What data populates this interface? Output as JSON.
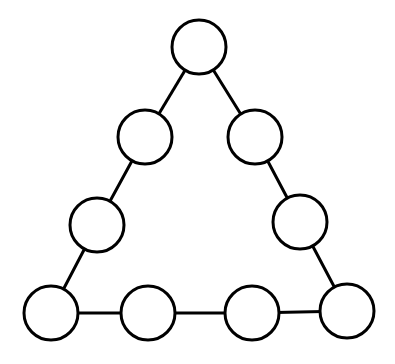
{
  "diagram": {
    "type": "triangle-node-puzzle",
    "canvas": {
      "width": 395,
      "height": 364,
      "background": "#ffffff"
    },
    "style": {
      "stroke": "#000000",
      "fill": "#ffffff",
      "node_radius": 27,
      "stroke_width": 3
    },
    "nodes": [
      {
        "id": "top",
        "cx": 199,
        "cy": 47,
        "label": ""
      },
      {
        "id": "left-upper",
        "cx": 145,
        "cy": 137,
        "label": ""
      },
      {
        "id": "left-lower",
        "cx": 97,
        "cy": 225,
        "label": ""
      },
      {
        "id": "bottom-left",
        "cx": 51,
        "cy": 313,
        "label": ""
      },
      {
        "id": "bottom-mid-1",
        "cx": 148,
        "cy": 313,
        "label": ""
      },
      {
        "id": "bottom-mid-2",
        "cx": 252,
        "cy": 313,
        "label": ""
      },
      {
        "id": "bottom-right",
        "cx": 347,
        "cy": 311,
        "label": ""
      },
      {
        "id": "right-lower",
        "cx": 300,
        "cy": 222,
        "label": ""
      },
      {
        "id": "right-upper",
        "cx": 255,
        "cy": 137,
        "label": ""
      }
    ],
    "edges": [
      [
        "top",
        "left-upper"
      ],
      [
        "left-upper",
        "left-lower"
      ],
      [
        "left-lower",
        "bottom-left"
      ],
      [
        "bottom-left",
        "bottom-mid-1"
      ],
      [
        "bottom-mid-1",
        "bottom-mid-2"
      ],
      [
        "bottom-mid-2",
        "bottom-right"
      ],
      [
        "bottom-right",
        "right-lower"
      ],
      [
        "right-lower",
        "right-upper"
      ],
      [
        "right-upper",
        "top"
      ]
    ]
  }
}
